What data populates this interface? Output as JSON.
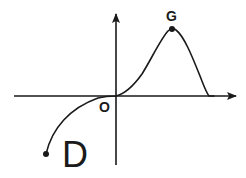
{
  "diagram": {
    "type": "function-graph",
    "colors": {
      "background": "#ffffff",
      "stroke": "#1a1a1a"
    },
    "axes": {
      "x_axis": {
        "from": [
          14,
          96
        ],
        "to": [
          236,
          96
        ],
        "arrow": true
      },
      "y_axis": {
        "from": [
          116,
          165
        ],
        "to": [
          116,
          14
        ],
        "arrow": true
      }
    },
    "labels": {
      "origin": "O",
      "peak": "G",
      "region": "D"
    },
    "points": [
      {
        "name": "G",
        "x": 172,
        "y": 29,
        "filled": true
      },
      {
        "name": "start",
        "x": 46,
        "y": 154,
        "filled": true
      }
    ],
    "curve_path": "M46,154 C52,128 70,108 98,98 C106,96 112,96 116,96 C124,94 132,88 142,74 C152,58 160,40 168,31 C170,29 174,28 176,30 C184,36 192,56 200,76 C204,86 206,92 209,96 L214,96"
  }
}
